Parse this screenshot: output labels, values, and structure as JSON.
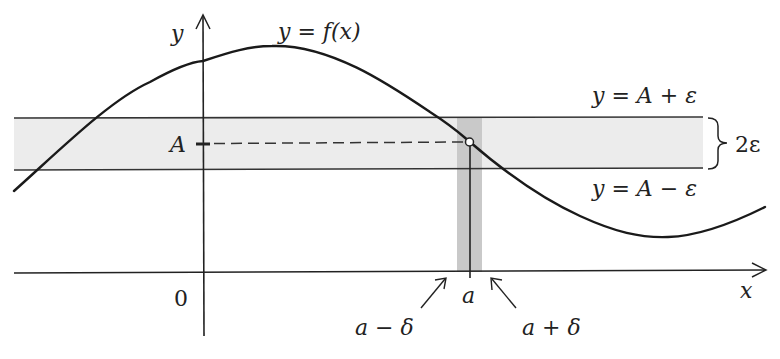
{
  "diagram": {
    "axes": {
      "x_label": "x",
      "y_label": "y",
      "origin_label": "0"
    },
    "curve": {
      "label": "y = f(x)"
    },
    "band": {
      "upper_label": "y = A + ε",
      "lower_label": "y = A − ε",
      "width_label": "2ε",
      "center_label": "A",
      "fill_color": "#ececec",
      "strip_color": "#c8c8c8"
    },
    "point": {
      "x_label": "a",
      "left_label": "a − δ",
      "right_label": "a + δ"
    }
  }
}
